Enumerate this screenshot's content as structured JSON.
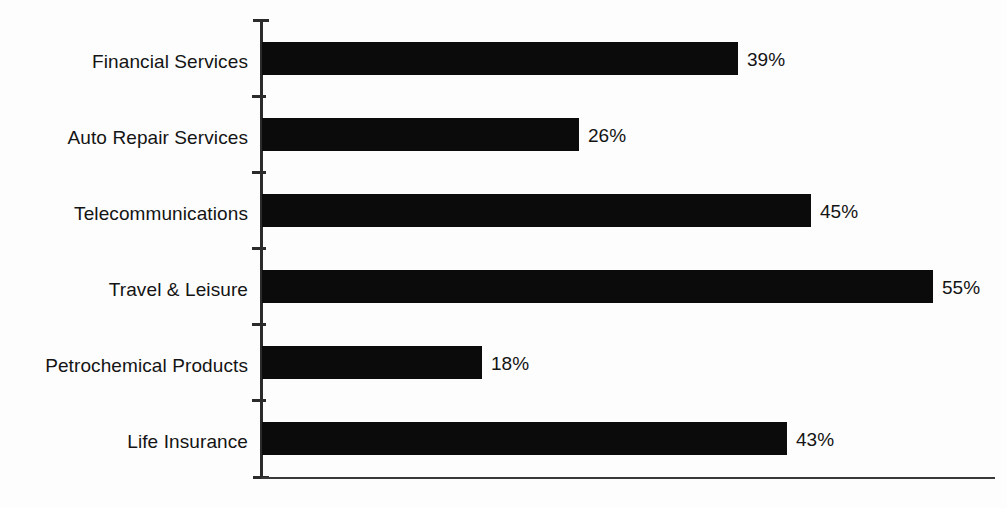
{
  "chart_data": {
    "type": "bar",
    "orientation": "horizontal",
    "title": "",
    "subtitle": "",
    "xlabel": "",
    "ylabel": "",
    "categories": [
      "Financial Services",
      "Auto Repair Services",
      "Telecommunications",
      "Travel & Leisure",
      "Petrochemical Products",
      "Life Insurance"
    ],
    "values": [
      39,
      26,
      45,
      55,
      18,
      43
    ],
    "value_labels": [
      "39%",
      "26%",
      "45%",
      "55%",
      "18%",
      "43%"
    ],
    "unit": "%",
    "xlim": [
      0,
      60
    ],
    "ylim": [
      0,
      6
    ],
    "grid": false,
    "legend": false,
    "legend_position": "none",
    "tick_labels_x": [],
    "series": [
      {
        "name": "Percentage",
        "values": [
          39,
          26,
          45,
          55,
          18,
          43
        ]
      }
    ],
    "colors": {
      "bar": "#0b0b0b",
      "axis": "#2b2b2b",
      "text": "#141414",
      "background": "#fdfdfd"
    }
  }
}
